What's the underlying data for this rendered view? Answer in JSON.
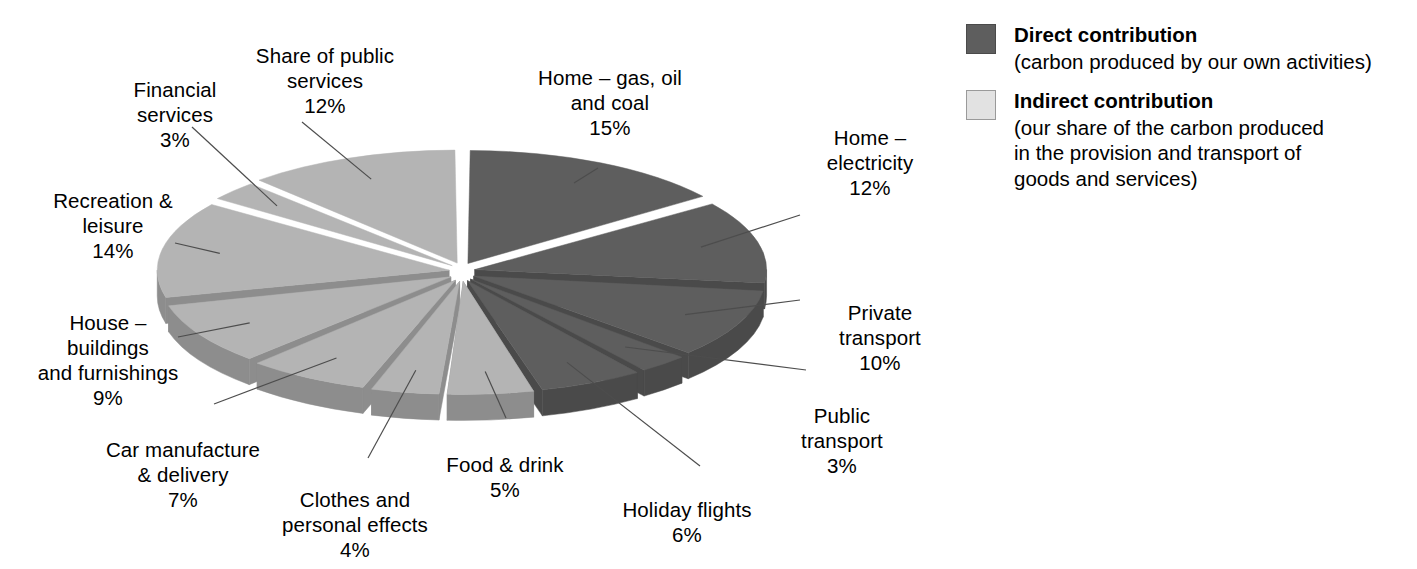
{
  "chart_data": {
    "type": "pie",
    "title": "",
    "subtitle": "",
    "xlabel": "",
    "ylabel": "",
    "grid": false,
    "legend_position": "right",
    "units": "%",
    "exploded": true,
    "three_d": true,
    "categories": [
      "Home – gas, oil and coal",
      "Home – electricity",
      "Private transport",
      "Public transport",
      "Holiday flights",
      "Food & drink",
      "Clothes and personal effects",
      "Car manufacture & delivery",
      "House – buildings and furnishings",
      "Recreation & leisure",
      "Financial services",
      "Share of public services"
    ],
    "values": [
      15,
      12,
      10,
      3,
      6,
      5,
      4,
      7,
      9,
      14,
      3,
      12
    ],
    "series": [
      {
        "name": "Carbon footprint share",
        "values": [
          15,
          12,
          10,
          3,
          6,
          5,
          4,
          7,
          9,
          14,
          3,
          12
        ]
      }
    ],
    "groups": [
      {
        "name": "Direct contribution",
        "color": "#5e5e5e",
        "categories": [
          "Home – gas, oil and coal",
          "Home – electricity",
          "Private transport",
          "Public transport",
          "Holiday flights"
        ],
        "total": 46
      },
      {
        "name": "Indirect contribution",
        "color": "#b4b4b4",
        "categories": [
          "Food & drink",
          "Clothes and personal effects",
          "Car manufacture & delivery",
          "House – buildings and furnishings",
          "Recreation & leisure",
          "Financial services",
          "Share of public services"
        ],
        "total": 54
      }
    ]
  },
  "colors": {
    "direct_top": "#5e5e5e",
    "direct_side": "#4a4a4a",
    "indirect_top": "#b4b4b4",
    "indirect_side": "#8d8d8d",
    "leader_line": "#4d4d4d",
    "background": "#ffffff",
    "text": "#000000"
  },
  "slices": [
    {
      "id": "home-gas-oil-coal",
      "label": "Home – gas, oil\nand coal",
      "pct": "15%",
      "value": 15,
      "group": "direct"
    },
    {
      "id": "home-electricity",
      "label": "Home –\nelectricity",
      "pct": "12%",
      "value": 12,
      "group": "direct"
    },
    {
      "id": "private-transport",
      "label": "Private\ntransport",
      "pct": "10%",
      "value": 10,
      "group": "direct"
    },
    {
      "id": "public-transport",
      "label": "Public\ntransport",
      "pct": "3%",
      "value": 3,
      "group": "direct"
    },
    {
      "id": "holiday-flights",
      "label": "Holiday flights",
      "pct": "6%",
      "value": 6,
      "group": "direct"
    },
    {
      "id": "food-and-drink",
      "label": "Food & drink",
      "pct": "5%",
      "value": 5,
      "group": "indirect"
    },
    {
      "id": "clothes-personal-effects",
      "label": "Clothes and\npersonal effects",
      "pct": "4%",
      "value": 4,
      "group": "indirect"
    },
    {
      "id": "car-manufacture-delivery",
      "label": "Car manufacture\n& delivery",
      "pct": "7%",
      "value": 7,
      "group": "indirect"
    },
    {
      "id": "house-buildings-furnishings",
      "label": "House –\nbuildings\nand furnishings",
      "pct": "9%",
      "value": 9,
      "group": "indirect"
    },
    {
      "id": "recreation-leisure",
      "label": "Recreation &\nleisure",
      "pct": "14%",
      "value": 14,
      "group": "indirect"
    },
    {
      "id": "financial-services",
      "label": "Financial\nservices",
      "pct": "3%",
      "value": 3,
      "group": "indirect"
    },
    {
      "id": "share-public-services",
      "label": "Share of public\nservices",
      "pct": "12%",
      "value": 12,
      "group": "indirect"
    }
  ],
  "legend": {
    "items": [
      {
        "title": "Direct contribution",
        "description": "(carbon produced by our own activities)"
      },
      {
        "title": "Indirect contribution",
        "description": "(our share of the carbon produced\nin the provision and transport of\ngoods and services)"
      }
    ]
  }
}
